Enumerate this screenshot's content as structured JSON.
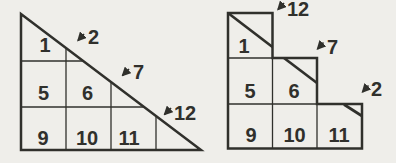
{
  "colors": {
    "paper": "#efeeea",
    "ink": "#30302c"
  },
  "left_diagram": {
    "description": "right triangle cut into a grid; diagonal slices cells",
    "cells": [
      "1",
      "5",
      "6",
      "9",
      "10",
      "11"
    ],
    "arrows": [
      "2",
      "7",
      "12"
    ]
  },
  "right_diagram": {
    "description": "staircase of squares with sliced corner pieces reattached",
    "cells": [
      "1",
      "5",
      "6",
      "9",
      "10",
      "11"
    ],
    "arrows": [
      "12",
      "7",
      "2"
    ]
  }
}
